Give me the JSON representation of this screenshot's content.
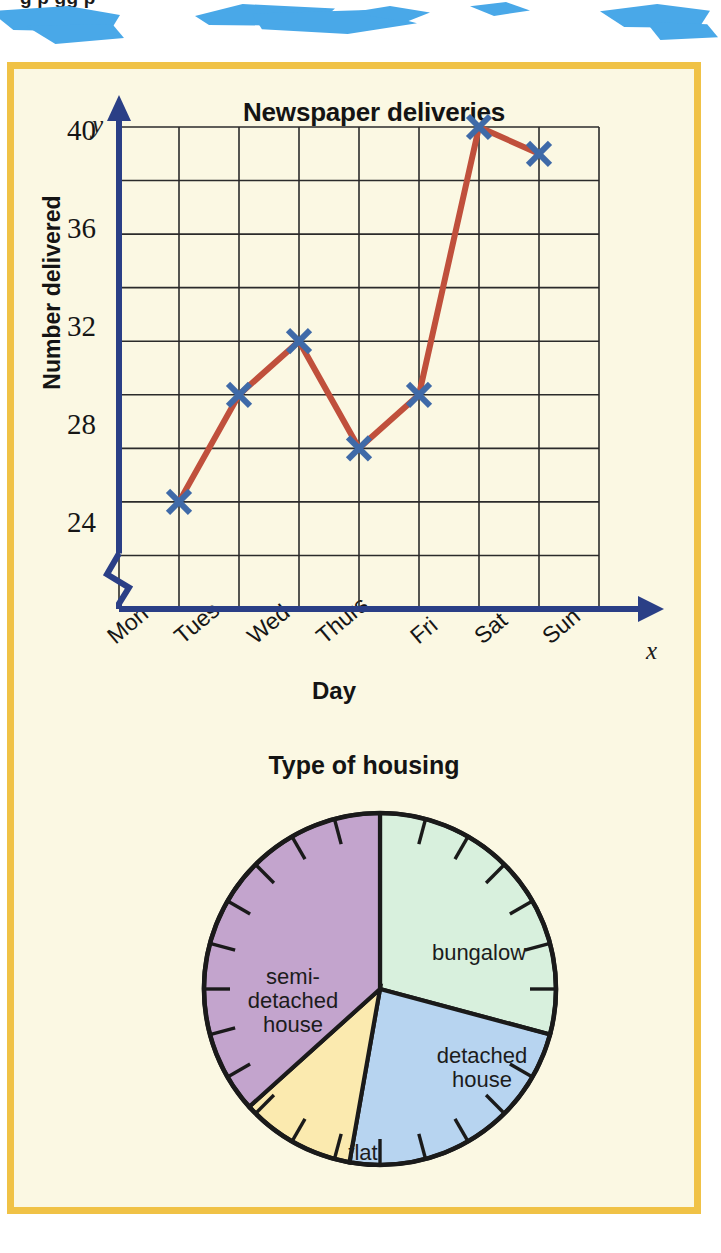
{
  "header": {
    "cut_off_text": "g                    p     gg  p",
    "splash_color": "#49a8e8"
  },
  "panel": {
    "background": "#fbf8e3",
    "border_color": "#f0c246"
  },
  "chart_data": [
    {
      "type": "line",
      "title": "Newspaper deliveries",
      "xlabel": "Day",
      "ylabel": "Number delivered",
      "x_axis_symbol": "x",
      "y_axis_symbol": "y",
      "categories": [
        "Mon",
        "Tues",
        "Wed",
        "Thurs",
        "Fri",
        "Sat",
        "Sun"
      ],
      "values": [
        26,
        30,
        32,
        28,
        30,
        40,
        39
      ],
      "ylim": [
        22,
        40
      ],
      "y_ticks": [
        40,
        36,
        32,
        28,
        24
      ],
      "y_gridline_step": 2,
      "axis_break": true,
      "grid": true,
      "legend": "none",
      "line_color": "#c0503c",
      "marker_color": "#3f6aa8",
      "marker_style": "x",
      "axis_color": "#2a3f86",
      "grid_color": "#2b2b2b"
    },
    {
      "type": "pie",
      "title": "Type of housing",
      "labels": [
        "bungalow",
        "detached house",
        "flat",
        "semi-detached house"
      ],
      "values": [
        29,
        24,
        10,
        37
      ],
      "angles_deg": [
        105,
        85,
        38,
        132
      ],
      "colors": [
        "#d8f0dd",
        "#b7d4f0",
        "#fbeaaf",
        "#c3a4cd"
      ],
      "outline_color": "#1a1a1a",
      "tick_count": 24,
      "tick_step_deg": 15,
      "start_angle_deg": 0
    }
  ],
  "pie_labels": {
    "bungalow": "bungalow",
    "detached_line1": "detached",
    "detached_line2": "house",
    "flat": "flat",
    "semi_line1": "semi-",
    "semi_line2": "detached",
    "semi_line3": "house"
  }
}
